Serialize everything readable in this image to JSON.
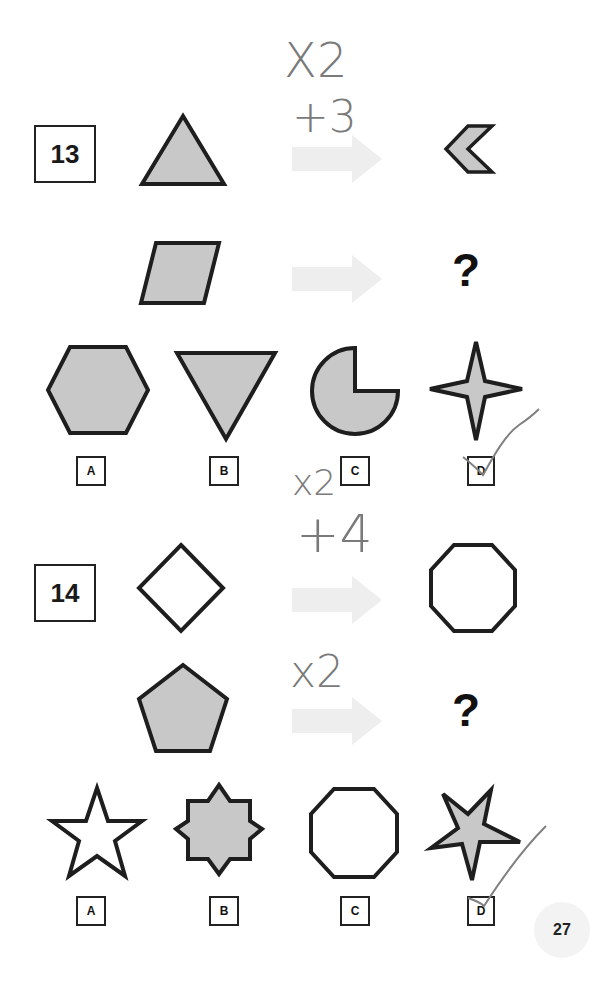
{
  "page": {
    "number": "27",
    "colors": {
      "shape_fill": "#c8c8c8",
      "stroke": "#1e1e1e",
      "arrow": "#eeeeee",
      "handwriting": "#7a7a7a"
    }
  },
  "puzzles": [
    {
      "number": "13",
      "row1": {
        "left_shape": "triangle-up-filled",
        "right_shape": "chevron-left-filled"
      },
      "row2": {
        "left_shape": "parallelogram-filled",
        "right": "?"
      },
      "options": [
        {
          "label": "A",
          "shape": "hexagon-filled"
        },
        {
          "label": "B",
          "shape": "triangle-down-filled"
        },
        {
          "label": "C",
          "shape": "pie-three-quarter-filled"
        },
        {
          "label": "D",
          "shape": "four-point-star-filled",
          "checked": true
        }
      ],
      "annotations": [
        "X2",
        "+3"
      ]
    },
    {
      "number": "14",
      "row1": {
        "left_shape": "diamond-outline",
        "right_shape": "octagon-outline"
      },
      "row2": {
        "left_shape": "pentagon-filled",
        "right": "?"
      },
      "options": [
        {
          "label": "A",
          "shape": "five-point-star-outline"
        },
        {
          "label": "B",
          "shape": "eight-point-star-filled"
        },
        {
          "label": "C",
          "shape": "octagon-outline"
        },
        {
          "label": "D",
          "shape": "five-point-star-filled",
          "checked": true
        }
      ],
      "annotations": [
        "x2",
        "+4",
        "x2"
      ]
    }
  ]
}
